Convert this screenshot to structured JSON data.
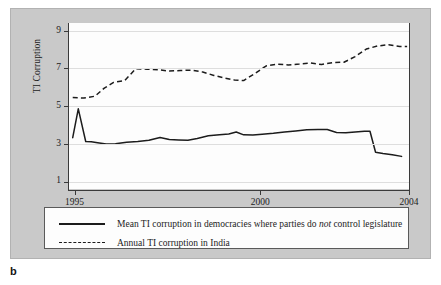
{
  "panel_letter": "b",
  "axes": {
    "y_title": "TI Corruption",
    "y_ticks": [
      1,
      3,
      5,
      7,
      9
    ],
    "x_ticks": [
      1995,
      2000,
      2004
    ]
  },
  "legend": {
    "entries": [
      {
        "style": "solid",
        "label_prefix": "Mean TI corruption in democracies where parties do ",
        "label_emphasis": "not",
        "label_suffix": " control legislature"
      },
      {
        "style": "dashed",
        "label_prefix": "Annual TI corruption in India",
        "label_emphasis": "",
        "label_suffix": ""
      }
    ]
  },
  "chart_data": {
    "type": "line",
    "title": "",
    "xlabel": "",
    "ylabel": "TI Corruption",
    "xlim": [
      1994.85,
      2004.0
    ],
    "ylim": [
      0.6,
      9.4
    ],
    "yticks": [
      1,
      3,
      5,
      7,
      9
    ],
    "xticks": [
      1995,
      2000,
      2004
    ],
    "grid": "horizontal",
    "legend_position": "below-plot",
    "series": [
      {
        "name": "Mean TI corruption in democracies where parties do not control legislature",
        "style": "solid",
        "color": "#1c1c1c",
        "x": [
          1994.95,
          1995.1,
          1995.3,
          1995.45,
          1995.62,
          1995.85,
          1996.1,
          1996.4,
          1996.7,
          1997.0,
          1997.3,
          1997.55,
          1997.8,
          1998.05,
          1998.3,
          1998.6,
          1998.9,
          1999.15,
          1999.35,
          1999.55,
          1999.8,
          2000.05,
          2000.35,
          2000.65,
          2000.95,
          2001.25,
          2001.55,
          2001.8,
          2002.05,
          2002.3,
          2002.55,
          2002.8,
          2002.95,
          2003.1,
          2003.3,
          2003.55,
          2003.8
        ],
        "y": [
          3.32,
          4.85,
          3.12,
          3.1,
          3.05,
          2.98,
          3.0,
          3.08,
          3.12,
          3.18,
          3.33,
          3.22,
          3.2,
          3.18,
          3.28,
          3.42,
          3.48,
          3.52,
          3.62,
          3.47,
          3.46,
          3.5,
          3.55,
          3.62,
          3.68,
          3.74,
          3.76,
          3.75,
          3.6,
          3.58,
          3.62,
          3.66,
          3.66,
          2.55,
          2.48,
          2.42,
          2.33
        ]
      },
      {
        "name": "Annual TI corruption in India",
        "style": "dashed",
        "color": "#1c1c1c",
        "x": [
          1994.95,
          1995.25,
          1995.55,
          1995.8,
          1996.05,
          1996.35,
          1996.65,
          1996.95,
          1997.25,
          1997.55,
          1997.85,
          1998.15,
          1998.45,
          1998.75,
          1999.05,
          1999.3,
          1999.55,
          1999.85,
          2000.15,
          2000.45,
          2000.75,
          2001.05,
          2001.35,
          2001.65,
          2001.95,
          2002.25,
          2002.55,
          2002.85,
          2003.15,
          2003.45,
          2003.75,
          2003.95
        ],
        "y": [
          5.45,
          5.42,
          5.52,
          5.95,
          6.25,
          6.35,
          6.98,
          6.95,
          6.92,
          6.85,
          6.88,
          6.9,
          6.8,
          6.62,
          6.48,
          6.38,
          6.35,
          6.72,
          7.12,
          7.22,
          7.18,
          7.22,
          7.28,
          7.2,
          7.3,
          7.32,
          7.62,
          8.02,
          8.18,
          8.25,
          8.15,
          8.15
        ]
      }
    ]
  }
}
